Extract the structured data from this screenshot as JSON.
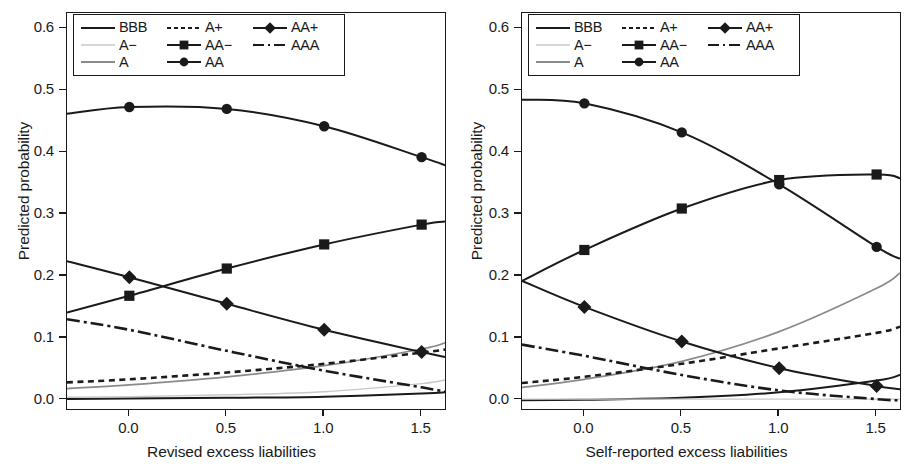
{
  "chart_data": [
    {
      "panel": "left",
      "type": "line",
      "title": "",
      "xlabel": "Revised excess liabilities",
      "ylabel": "Predicted probability",
      "xlim": [
        -0.32,
        1.62
      ],
      "ylim": [
        -0.015,
        0.625
      ],
      "xticks": [
        0.0,
        0.5,
        1.0,
        1.5
      ],
      "xticklabels": [
        "0.0",
        "0.5",
        "1.0",
        "1.5"
      ],
      "yticks": [
        0.0,
        0.1,
        0.2,
        0.3,
        0.4,
        0.5,
        0.6
      ],
      "yticklabels": [
        "0.0",
        "0.1",
        "0.2",
        "0.3",
        "0.4",
        "0.5",
        "0.6"
      ],
      "grid": false,
      "legend_position": "top-left",
      "marker_x": [
        0.0,
        0.5,
        1.0,
        1.5
      ],
      "series": [
        {
          "name": "BBB",
          "style": "solid",
          "color": "#1a1a1a",
          "marker": "none",
          "x": [
            -0.32,
            0.0,
            0.5,
            1.0,
            1.5,
            1.62
          ],
          "values": [
            0.001,
            0.002,
            0.003,
            0.005,
            0.01,
            0.012
          ]
        },
        {
          "name": "A-",
          "style": "solid",
          "color": "#c9c9c9",
          "marker": "none",
          "x": [
            -0.32,
            0.0,
            0.5,
            1.0,
            1.5,
            1.62
          ],
          "values": [
            0.004,
            0.005,
            0.008,
            0.013,
            0.026,
            0.032
          ]
        },
        {
          "name": "A",
          "style": "solid",
          "color": "#8a8a8a",
          "marker": "none",
          "x": [
            -0.32,
            0.0,
            0.5,
            1.0,
            1.5,
            1.62
          ],
          "values": [
            0.018,
            0.024,
            0.037,
            0.055,
            0.082,
            0.092
          ]
        },
        {
          "name": "A+",
          "style": "dotted",
          "color": "#1a1a1a",
          "marker": "none",
          "x": [
            -0.32,
            0.0,
            0.5,
            1.0,
            1.5,
            1.62
          ],
          "values": [
            0.028,
            0.033,
            0.044,
            0.058,
            0.076,
            0.081
          ]
        },
        {
          "name": "AA-",
          "style": "solid",
          "color": "#1a1a1a",
          "marker": "square",
          "x": [
            -0.32,
            0.0,
            0.5,
            1.0,
            1.5,
            1.62
          ],
          "values": [
            0.141,
            0.168,
            0.212,
            0.251,
            0.283,
            0.288
          ]
        },
        {
          "name": "AA",
          "style": "solid",
          "color": "#1a1a1a",
          "marker": "circle",
          "x": [
            -0.32,
            0.0,
            0.5,
            1.0,
            1.5,
            1.62
          ],
          "values": [
            0.462,
            0.473,
            0.47,
            0.442,
            0.392,
            0.379
          ]
        },
        {
          "name": "AA+",
          "style": "solid",
          "color": "#1a1a1a",
          "marker": "diamond",
          "x": [
            -0.32,
            0.0,
            0.5,
            1.0,
            1.5,
            1.62
          ],
          "values": [
            0.224,
            0.198,
            0.155,
            0.113,
            0.077,
            0.069
          ]
        },
        {
          "name": "AAA",
          "style": "dashdot",
          "color": "#1a1a1a",
          "marker": "none",
          "x": [
            -0.32,
            0.0,
            0.5,
            1.0,
            1.5,
            1.62
          ],
          "values": [
            0.13,
            0.113,
            0.079,
            0.047,
            0.02,
            0.013
          ]
        }
      ]
    },
    {
      "panel": "right",
      "type": "line",
      "title": "",
      "xlabel": "Self-reported excess liabilities",
      "ylabel": "Predicted probability",
      "xlim": [
        -0.32,
        1.62
      ],
      "ylim": [
        -0.015,
        0.625
      ],
      "xticks": [
        0.0,
        0.5,
        1.0,
        1.5
      ],
      "xticklabels": [
        "0.0",
        "0.5",
        "1.0",
        "1.5"
      ],
      "yticks": [
        0.0,
        0.1,
        0.2,
        0.3,
        0.4,
        0.5,
        0.6
      ],
      "yticklabels": [
        "0.0",
        "0.1",
        "0.2",
        "0.3",
        "0.4",
        "0.5",
        "0.6"
      ],
      "grid": false,
      "legend_position": "top-left",
      "marker_x": [
        0.0,
        0.5,
        1.0,
        1.5
      ],
      "series": [
        {
          "name": "BBB",
          "style": "solid",
          "color": "#1a1a1a",
          "marker": "none",
          "x": [
            -0.32,
            0.0,
            0.5,
            1.0,
            1.5,
            1.62
          ],
          "values": [
            -0.001,
            0.0,
            0.003,
            0.012,
            0.031,
            0.04
          ]
        },
        {
          "name": "A-",
          "style": "solid",
          "color": "#c9c9c9",
          "marker": "none",
          "x": [
            -0.32,
            0.0,
            0.5,
            1.0,
            1.5,
            1.62
          ],
          "values": [
            0.001,
            0.001,
            0.001,
            0.001,
            0.001,
            0.001
          ]
        },
        {
          "name": "A",
          "style": "solid",
          "color": "#8a8a8a",
          "marker": "none",
          "x": [
            -0.32,
            0.0,
            0.5,
            1.0,
            1.5,
            1.62
          ],
          "values": [
            0.02,
            0.033,
            0.062,
            0.11,
            0.18,
            0.205
          ]
        },
        {
          "name": "A+",
          "style": "dotted",
          "color": "#1a1a1a",
          "marker": "none",
          "x": [
            -0.32,
            0.0,
            0.5,
            1.0,
            1.5,
            1.62
          ],
          "values": [
            0.027,
            0.037,
            0.058,
            0.083,
            0.108,
            0.118
          ]
        },
        {
          "name": "AA-",
          "style": "solid",
          "color": "#1a1a1a",
          "marker": "square",
          "x": [
            -0.32,
            0.0,
            0.5,
            1.0,
            1.5,
            1.62
          ],
          "values": [
            0.192,
            0.242,
            0.309,
            0.355,
            0.364,
            0.358
          ]
        },
        {
          "name": "AA",
          "style": "solid",
          "color": "#1a1a1a",
          "marker": "circle",
          "x": [
            -0.32,
            0.0,
            0.5,
            1.0,
            1.5,
            1.62
          ],
          "values": [
            0.485,
            0.479,
            0.432,
            0.348,
            0.247,
            0.228
          ]
        },
        {
          "name": "AA+",
          "style": "solid",
          "color": "#1a1a1a",
          "marker": "diamond",
          "x": [
            -0.32,
            0.0,
            0.5,
            1.0,
            1.5,
            1.62
          ],
          "values": [
            0.192,
            0.15,
            0.094,
            0.051,
            0.022,
            0.017
          ]
        },
        {
          "name": "AAA",
          "style": "dashdot",
          "color": "#1a1a1a",
          "marker": "none",
          "x": [
            -0.32,
            0.0,
            0.5,
            1.0,
            1.5,
            1.62
          ],
          "values": [
            0.089,
            0.071,
            0.04,
            0.015,
            0.001,
            -0.001
          ]
        }
      ]
    }
  ],
  "legend": {
    "entries": [
      {
        "label": "BBB",
        "style": "solid",
        "color": "#1a1a1a",
        "marker": "none"
      },
      {
        "label": "A+",
        "style": "dotted",
        "color": "#1a1a1a",
        "marker": "none"
      },
      {
        "label": "AA+",
        "style": "solid",
        "color": "#1a1a1a",
        "marker": "diamond"
      },
      {
        "label": "A−",
        "style": "solid",
        "color": "#c9c9c9",
        "marker": "none"
      },
      {
        "label": "AA−",
        "style": "solid",
        "color": "#1a1a1a",
        "marker": "square"
      },
      {
        "label": "AAA",
        "style": "dashdot",
        "color": "#1a1a1a",
        "marker": "none"
      },
      {
        "label": "A",
        "style": "solid",
        "color": "#8a8a8a",
        "marker": "none"
      },
      {
        "label": "AA",
        "style": "solid",
        "color": "#1a1a1a",
        "marker": "circle"
      },
      {
        "label": "",
        "style": "none",
        "color": "#1a1a1a",
        "marker": "none"
      }
    ]
  }
}
